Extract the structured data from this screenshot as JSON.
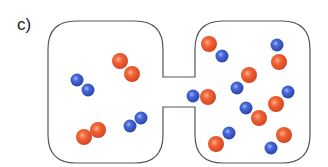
{
  "panel": {
    "label": "c)"
  },
  "colors": {
    "outline": "#555555",
    "oxygen": "#e8532a",
    "nitrogen": "#3a5bc7",
    "background": "#ffffff"
  },
  "apparatus": {
    "left_container": {
      "x": 48,
      "y": 21,
      "w": 115,
      "h": 142,
      "r": 28
    },
    "right_container": {
      "x": 195,
      "y": 21,
      "w": 115,
      "h": 142,
      "r": 28
    },
    "tube": {
      "x1": 163,
      "x2": 195,
      "y_top": 77,
      "y_bottom": 107
    }
  },
  "molecules": {
    "left": [
      {
        "type": "N2",
        "atoms": [
          {
            "el": "N",
            "x": 77,
            "y": 80
          },
          {
            "el": "N",
            "x": 88,
            "y": 90
          }
        ]
      },
      {
        "type": "O2",
        "atoms": [
          {
            "el": "O",
            "x": 120,
            "y": 61
          },
          {
            "el": "O",
            "x": 132,
            "y": 74
          }
        ]
      },
      {
        "type": "O2",
        "atoms": [
          {
            "el": "O",
            "x": 84,
            "y": 137
          },
          {
            "el": "O",
            "x": 98,
            "y": 130
          }
        ]
      },
      {
        "type": "N2",
        "atoms": [
          {
            "el": "N",
            "x": 130,
            "y": 126
          },
          {
            "el": "N",
            "x": 141,
            "y": 118
          }
        ]
      }
    ],
    "right": [
      {
        "type": "NO",
        "atoms": [
          {
            "el": "O",
            "x": 209,
            "y": 44
          },
          {
            "el": "N",
            "x": 222,
            "y": 56
          }
        ]
      },
      {
        "type": "NO",
        "atoms": [
          {
            "el": "N",
            "x": 277,
            "y": 45
          },
          {
            "el": "O",
            "x": 279,
            "y": 62
          }
        ]
      },
      {
        "type": "NO",
        "atoms": [
          {
            "el": "O",
            "x": 249,
            "y": 75
          },
          {
            "el": "N",
            "x": 237,
            "y": 88
          }
        ]
      },
      {
        "type": "NO",
        "atoms": [
          {
            "el": "N",
            "x": 193,
            "y": 96
          },
          {
            "el": "O",
            "x": 208,
            "y": 97
          }
        ]
      },
      {
        "type": "NO",
        "atoms": [
          {
            "el": "N",
            "x": 288,
            "y": 92
          },
          {
            "el": "O",
            "x": 276,
            "y": 104
          }
        ]
      },
      {
        "type": "NO",
        "atoms": [
          {
            "el": "N",
            "x": 246,
            "y": 108
          },
          {
            "el": "O",
            "x": 259,
            "y": 118
          }
        ]
      },
      {
        "type": "NO",
        "atoms": [
          {
            "el": "N",
            "x": 229,
            "y": 133
          },
          {
            "el": "O",
            "x": 216,
            "y": 144
          }
        ]
      },
      {
        "type": "NO",
        "atoms": [
          {
            "el": "O",
            "x": 284,
            "y": 135
          },
          {
            "el": "N",
            "x": 271,
            "y": 148
          }
        ]
      }
    ]
  },
  "atom_radius": {
    "O": 8,
    "N": 6.5
  }
}
